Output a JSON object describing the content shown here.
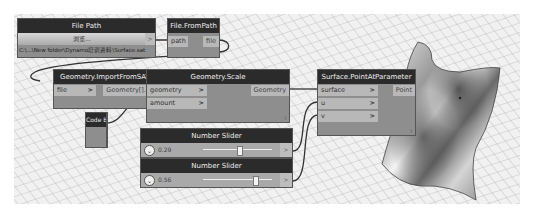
{
  "nodes": {
    "file_path": {
      "title": "File Path",
      "browse_label": "浏览...",
      "value": "C:\\...\\New folder\\Dynamo培训资料\\Surface.sat",
      "output_arrow": ">"
    },
    "file_from_path": {
      "title": "File.FromPath",
      "input": "path",
      "output": "file"
    },
    "import_sat": {
      "title": "Geometry.ImportFromSAT",
      "input": "file",
      "output": "Geometry[]..[]",
      "lacing": "l"
    },
    "geometry_scale": {
      "title": "Geometry.Scale",
      "inputs": [
        "geometry",
        "amount"
      ],
      "output": "Geometry",
      "lacing": "l"
    },
    "code_block": {
      "title": "Code Block",
      "code": "100;",
      "output_arrow": ">"
    },
    "slider_u": {
      "title": "Number Slider",
      "value": "0.29",
      "position_pct": 29
    },
    "slider_v": {
      "title": "Number Slider",
      "value": "0.56",
      "position_pct": 56
    },
    "point_at_param": {
      "title": "Surface.PointAtParameter",
      "inputs": [
        "surface",
        "u",
        "v"
      ],
      "output": "Point",
      "lacing": "l"
    }
  },
  "icons": {
    "port_arrow": ">",
    "chevron": "⌄"
  },
  "colors": {
    "node_header": "#2b2b2b",
    "node_body": "#8e8e8e",
    "port": "#b8b8b8",
    "canvas": "#f1f1f1",
    "wire": "#333333"
  }
}
